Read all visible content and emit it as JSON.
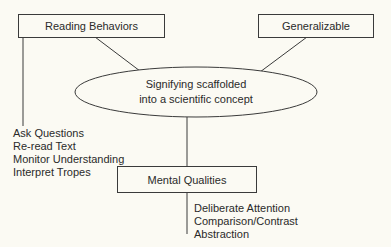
{
  "diagram": {
    "nodes": {
      "reading_behaviors": {
        "label": "Reading Behaviors"
      },
      "generalizable": {
        "label": "Generalizable"
      },
      "center": {
        "line1": "Signifying scaffolded",
        "line2": "into a scientific concept"
      },
      "mental_qualities": {
        "label": "Mental Qualities"
      }
    },
    "reading_behaviors_items": [
      "Ask Questions",
      "Re-read Text",
      "Monitor Understanding",
      "Interpret Tropes"
    ],
    "mental_qualities_items": [
      "Deliberate Attention",
      "Comparison/Contrast",
      "Abstraction"
    ],
    "edges": [
      {
        "from": "reading_behaviors",
        "to": "center"
      },
      {
        "from": "generalizable",
        "to": "center"
      },
      {
        "from": "center",
        "to": "mental_qualities"
      },
      {
        "from": "reading_behaviors",
        "to": "reading_behaviors_items"
      },
      {
        "from": "mental_qualities",
        "to": "mental_qualities_items"
      }
    ],
    "colors": {
      "background": "#fbfaf3",
      "stroke": "#3a3a3a",
      "text": "#2a2a2a"
    }
  }
}
